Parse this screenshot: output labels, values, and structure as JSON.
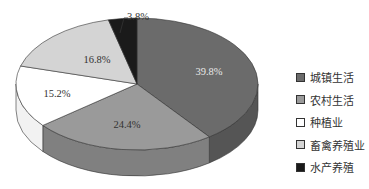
{
  "chart_data": {
    "type": "pie",
    "style": "3d",
    "title": "",
    "slices": [
      {
        "label": "城镇生活",
        "value": 39.8,
        "label_text": "39.8%",
        "color": "#6b6b6b",
        "side_color": "#555555",
        "text_color": "#e8e8e8"
      },
      {
        "label": "农村生活",
        "value": 24.4,
        "label_text": "24.4%",
        "color": "#9a9a9a",
        "side_color": "#808080",
        "text_color": "#333333"
      },
      {
        "label": "种植业",
        "value": 15.2,
        "label_text": "15.2%",
        "color": "#ffffff",
        "side_color": "#f2f2f2",
        "text_color": "#333333"
      },
      {
        "label": "畜禽养殖业",
        "value": 16.8,
        "label_text": "16.8%",
        "color": "#d4d4d4",
        "side_color": "#bdbdbd",
        "text_color": "#333333"
      },
      {
        "label": "水产养殖",
        "value": 3.8,
        "label_text": "3.8%",
        "color": "#1a1a1a",
        "side_color": "#111111",
        "text_color": "#333333"
      }
    ],
    "legend_position": "right"
  },
  "legend": {
    "items": [
      {
        "label": "城镇生活",
        "color": "#6b6b6b"
      },
      {
        "label": "农村生活",
        "color": "#9a9a9a"
      },
      {
        "label": "种植业",
        "color": "#ffffff"
      },
      {
        "label": "畜禽养殖业",
        "color": "#d4d4d4"
      },
      {
        "label": "水产养殖",
        "color": "#1a1a1a"
      }
    ]
  }
}
